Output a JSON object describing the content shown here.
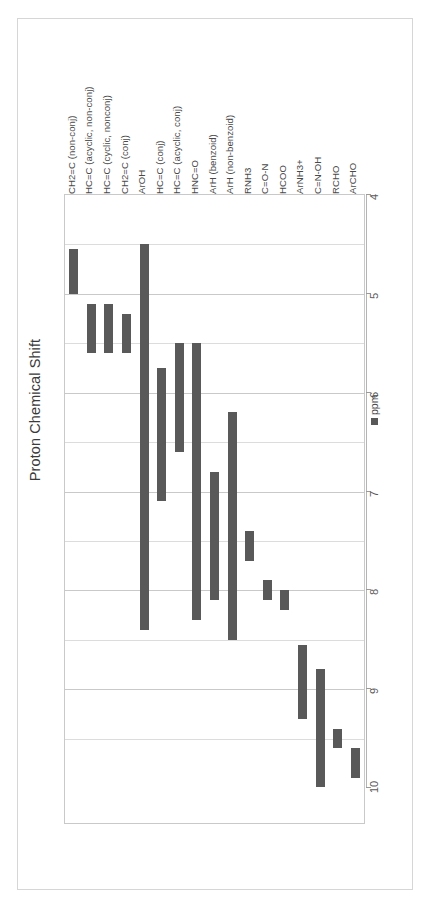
{
  "chart_data": {
    "type": "bar",
    "orientation": "vertical-ranges",
    "title": "Proton Chemical Shift",
    "xlabel": "",
    "ylabel": "ppm",
    "ylim": [
      4,
      10
    ],
    "y_inverted": true,
    "grid": true,
    "legend_position": "right",
    "legend_entries": [
      "ppm"
    ],
    "tick_labels": [
      "4",
      "5",
      "6",
      "7",
      "8",
      "9",
      "10"
    ],
    "tick_values": [
      4,
      5,
      6,
      7,
      8,
      9,
      10
    ],
    "minor_gridline_values": [
      4.5,
      5.5,
      6.5,
      7.5,
      8.5,
      9.5
    ],
    "bar_color": "#595959",
    "categories": [
      "CH2=C (non-conj)",
      "HC=C (acyclic, non-conj)",
      "HC=C (cyclic, nonconj)",
      "CH2=C (conj)",
      "ArOH",
      "HC=C (conj)",
      "HC=C (acyclic, conj)",
      "HNC=O",
      "ArH (benzoid)",
      "ArH (non-benzoid)",
      "RNH3",
      "C=O-N",
      "HCOO",
      "ArNH3+",
      "C=N-OH",
      "RCHO",
      "ArCHO"
    ],
    "ranges": [
      {
        "label": "CH2=C (non-conj)",
        "start": 4.55,
        "end": 5.0
      },
      {
        "label": "HC=C (acyclic, non-conj)",
        "start": 5.1,
        "end": 5.6
      },
      {
        "label": "HC=C (cyclic, nonconj)",
        "start": 5.1,
        "end": 5.6
      },
      {
        "label": "CH2=C (conj)",
        "start": 5.2,
        "end": 5.6
      },
      {
        "label": "ArOH",
        "start": 4.5,
        "end": 8.4
      },
      {
        "label": "HC=C (conj)",
        "start": 5.75,
        "end": 7.1
      },
      {
        "label": "HC=C (acyclic, conj)",
        "start": 5.5,
        "end": 6.6
      },
      {
        "label": "HNC=O",
        "start": 5.5,
        "end": 8.3
      },
      {
        "label": "ArH (benzoid)",
        "start": 6.8,
        "end": 8.1
      },
      {
        "label": "ArH (non-benzoid)",
        "start": 6.2,
        "end": 8.5
      },
      {
        "label": "RNH3",
        "start": 7.4,
        "end": 7.7
      },
      {
        "label": "C=O-N",
        "start": 7.9,
        "end": 8.1
      },
      {
        "label": "HCOO",
        "start": 8.0,
        "end": 8.2
      },
      {
        "label": "ArNH3+",
        "start": 8.55,
        "end": 9.3
      },
      {
        "label": "C=N-OH",
        "start": 8.8,
        "end": 10.1
      },
      {
        "label": "RCHO",
        "start": 9.4,
        "end": 9.6
      },
      {
        "label": "ArCHO",
        "start": 9.6,
        "end": 9.9
      }
    ]
  },
  "legend": {
    "label": "ppm",
    "swatch_color": "#595959"
  }
}
